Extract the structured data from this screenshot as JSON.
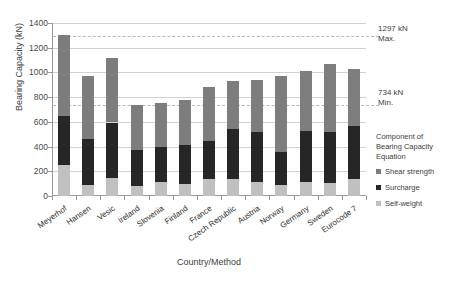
{
  "chart_data": {
    "type": "bar",
    "stacked": true,
    "title": "",
    "xlabel": "Country/Method",
    "ylabel": "Bearing Capacity (kN)",
    "ylim": [
      0,
      1400
    ],
    "ytick_step": 200,
    "yticks": [
      0,
      200,
      400,
      600,
      800,
      1000,
      1200,
      1400
    ],
    "grid": true,
    "legend_position": "right",
    "legend_title": "Component of Bearing Capacity Equation",
    "categories": [
      "Meyerhof",
      "Hansen",
      "Vesic",
      "Ireland",
      "Slovenia",
      "Finland",
      "France",
      "Czech Republic",
      "Austria",
      "Norway",
      "Germany",
      "Sweden",
      "Eurocode 7"
    ],
    "series": [
      {
        "name": "Self-weight",
        "color": "#c0c0c0",
        "values": [
          250,
          90,
          145,
          85,
          115,
          95,
          140,
          135,
          110,
          90,
          115,
          105,
          140
        ]
      },
      {
        "name": "Surcharge",
        "color": "#262626",
        "values": [
          400,
          375,
          450,
          290,
          285,
          320,
          305,
          405,
          410,
          270,
          415,
          415,
          430
        ]
      },
      {
        "name": "Shear strength",
        "color": "#7d7d7d",
        "values": [
          650,
          510,
          520,
          360,
          355,
          365,
          435,
          390,
          420,
          615,
          480,
          550,
          460
        ]
      }
    ],
    "totals": [
      1300,
      975,
      1115,
      735,
      755,
      780,
      880,
      930,
      940,
      975,
      1010,
      1070,
      1030
    ],
    "reference_lines": [
      {
        "name": "max",
        "value": 1297,
        "label_value": "1297 kN",
        "label_text": "Max.",
        "style": "dashed"
      },
      {
        "name": "min",
        "value": 734,
        "label_value": "734 kN",
        "label_text": "Min.",
        "style": "dashed"
      }
    ]
  },
  "legend": {
    "title_lines": [
      "Component of",
      "Bearing Capacity",
      "Equation"
    ],
    "items": [
      {
        "label": "Shear strength",
        "color": "#7d7d7d"
      },
      {
        "label": "Surcharge",
        "color": "#262626"
      },
      {
        "label": "Self-weight",
        "color": "#c0c0c0"
      }
    ]
  }
}
